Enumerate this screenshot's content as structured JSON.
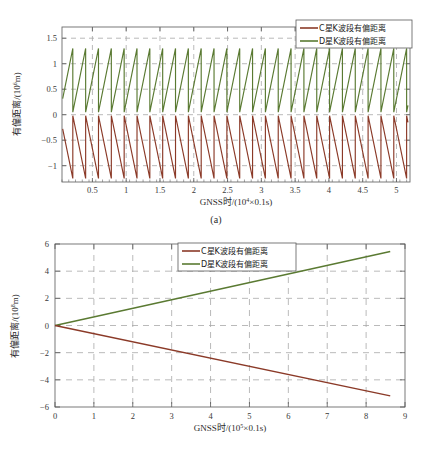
{
  "figure": {
    "panels": [
      {
        "caption": "(a)",
        "xlabel_prefix": "GNSS时/(10",
        "xlabel_exp": "4",
        "xlabel_suffix": "×0.1s)",
        "ylabel_prefix": "有偏距离/(10",
        "ylabel_exp": "6",
        "ylabel_suffix": "m)",
        "legend": [
          {
            "label": "C星K波段有偏距离",
            "color": "#8b3a28"
          },
          {
            "label": "D星K波段有偏距离",
            "color": "#5a7a32"
          }
        ],
        "xticks": [
          "0.5",
          "1",
          "1.5",
          "2",
          "2.5",
          "3",
          "3.5",
          "4",
          "4.5",
          "5"
        ],
        "yticks": [
          "1.5",
          "1",
          "0.5",
          "0",
          "−0.5",
          "−1"
        ]
      },
      {
        "caption": "(b)",
        "xlabel_prefix": "GNSS时/(10",
        "xlabel_exp": "5",
        "xlabel_suffix": "×0.1s)",
        "ylabel_prefix": "有偏距离/(10",
        "ylabel_exp": "8",
        "ylabel_suffix": "m)",
        "legend": [
          {
            "label": "C星K波段有偏距离",
            "color": "#8b3a28"
          },
          {
            "label": "D星K波段有偏距离",
            "color": "#5a7a32"
          }
        ],
        "xticks": [
          "0",
          "1",
          "2",
          "3",
          "4",
          "5",
          "6",
          "7",
          "8",
          "9"
        ],
        "yticks": [
          "6",
          "4",
          "2",
          "0",
          "−2",
          "−4",
          "−6"
        ]
      }
    ]
  },
  "chart_data": [
    {
      "type": "line",
      "panel": "(a)",
      "title": "",
      "xlabel": "GNSS时/(10^4×0.1s)",
      "ylabel": "有偏距离/(10^6 m)",
      "xlim": [
        0.05,
        5.2
      ],
      "ylim": [
        -1.32,
        1.72
      ],
      "xticks": [
        0.5,
        1,
        1.5,
        2,
        2.5,
        3,
        3.5,
        4,
        4.5,
        5
      ],
      "yticks": [
        1.5,
        1,
        0.5,
        0,
        -0.5,
        -1
      ],
      "grid": true,
      "legend_position": "top-right",
      "series": [
        {
          "name": "D星K波段有偏距离",
          "color": "#5a7a32",
          "waveform": "sawtooth-rising",
          "period": 0.19,
          "phase": 0.02,
          "ymin": 0.05,
          "ymax": 1.3,
          "x_start": 0.06,
          "x_end": 5.17
        },
        {
          "name": "C星K波段有偏距离",
          "color": "#8b3a28",
          "waveform": "sawtooth-falling",
          "period": 0.19,
          "phase": 0.02,
          "ymin": -1.25,
          "ymax": -0.02,
          "x_start": 0.06,
          "x_end": 5.17
        }
      ]
    },
    {
      "type": "line",
      "panel": "(b)",
      "title": "",
      "xlabel": "GNSS时/(10^5×0.1s)",
      "ylabel": "有偏距离/(10^8 m)",
      "xlim": [
        0,
        9
      ],
      "ylim": [
        -6,
        6
      ],
      "xticks": [
        0,
        1,
        2,
        3,
        4,
        5,
        6,
        7,
        8,
        9
      ],
      "yticks": [
        6,
        4,
        2,
        0,
        -2,
        -4,
        -6
      ],
      "grid": true,
      "legend_position": "top-center",
      "series": [
        {
          "name": "D星K波段有偏距离",
          "color": "#5a7a32",
          "points": [
            [
              0,
              0
            ],
            [
              8.62,
              5.45
            ]
          ]
        },
        {
          "name": "C星K波段有偏距离",
          "color": "#8b3a28",
          "points": [
            [
              0,
              0
            ],
            [
              8.62,
              -5.18
            ]
          ]
        }
      ]
    }
  ]
}
